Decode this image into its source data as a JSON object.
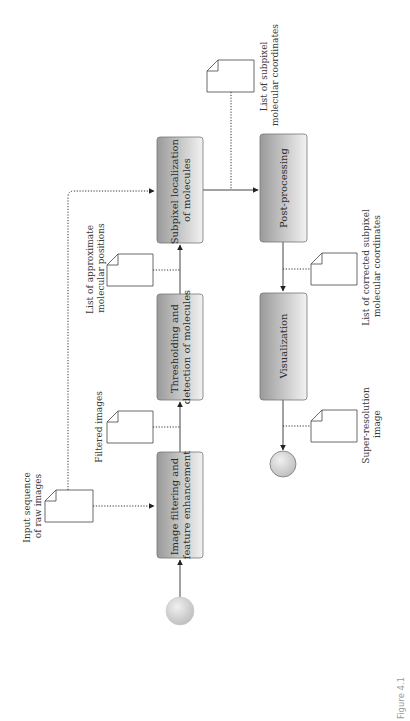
{
  "diagram": {
    "caption": "Figure 4.1",
    "orientation": "rotated -90deg",
    "colors": {
      "box_dark": "#9a9a9a",
      "box_light": "#f2f2f2",
      "box_border": "#777777",
      "line": "#333333",
      "doc_border": "#444444",
      "circle_dark": "#b5b5b5",
      "circle_light": "#f0f0f0",
      "caption": "#9a9a9a"
    },
    "process_boxes": [
      {
        "id": "filter",
        "line1": "Image filtering and",
        "line2": "feature enhancement"
      },
      {
        "id": "threshold",
        "line1": "Thresholding and",
        "line2": "detection of molecules"
      },
      {
        "id": "subpixel",
        "line1": "Subpixel localization",
        "line2": "of molecules"
      },
      {
        "id": "postproc",
        "line1": "Post-processing",
        "line2": ""
      },
      {
        "id": "visual",
        "line1": "Visualization",
        "line2": ""
      }
    ],
    "documents": [
      {
        "id": "raw",
        "line1": "Input sequence",
        "line2": "of raw images"
      },
      {
        "id": "filtered",
        "line1": "Filtered images",
        "line2": ""
      },
      {
        "id": "approx",
        "line1": "List of approximate",
        "line2": "molecular positions"
      },
      {
        "id": "subpix",
        "line1": "List of subpixel",
        "line2": "molecular coordinates"
      },
      {
        "id": "corrected",
        "line1": "List of corrected subpixel",
        "line2": "molecular coordinates"
      },
      {
        "id": "superres",
        "line1": "Super-resolution",
        "line2": "image"
      }
    ],
    "terminals": [
      {
        "id": "start",
        "label": "start"
      },
      {
        "id": "end",
        "label": "end"
      }
    ]
  }
}
